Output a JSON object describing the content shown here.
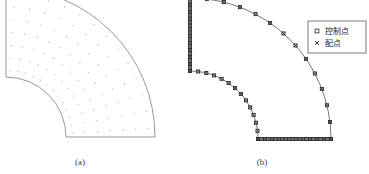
{
  "figure": {
    "type": "geometry-diagram",
    "background_color": "#ffffff",
    "panels": [
      {
        "id": "a",
        "caption": "(a)",
        "caption_x": 80,
        "caption_y": 165,
        "description": "quarter annulus domain with interior sampling point grid",
        "outline_color": "#8c8c8c",
        "fill_color": "#ffffff",
        "point_color": "#a8a8a8",
        "center_x": 6,
        "center_y": 137,
        "inner_radius": 60,
        "outer_radius": 149,
        "start_angle_deg": 0,
        "end_angle_deg": 90,
        "grid_radial_count": 7,
        "grid_circum_count": 13
      },
      {
        "id": "b",
        "caption": "(b)",
        "caption_x": 262,
        "caption_y": 165,
        "description": "quarter annulus boundary discretization showing control points and collocation points",
        "outline_color": "#555555",
        "marker_color": "#1a1a1a",
        "center_x": 190,
        "center_y": 139,
        "inner_radius": 68,
        "outer_radius": 141,
        "start_angle_deg": 0,
        "end_angle_deg": 90,
        "outer_arc_points": 14,
        "inner_arc_points": 14,
        "left_edge_points": 22,
        "bottom_edge_points": 22
      }
    ],
    "legend": {
      "box_x": 308,
      "box_y": 21,
      "box_width": 58,
      "box_height": 32,
      "border_color": "#6b6b6b",
      "fill_color": "#ffffff",
      "entries": [
        {
          "marker": "open-square",
          "label": "控制点"
        },
        {
          "marker": "cross",
          "label": "配点"
        }
      ]
    }
  },
  "chart_data": {
    "type": "scatter",
    "title": "",
    "xlabel": "",
    "ylabel": "",
    "grid": false,
    "legend_position": "top-right",
    "series": [
      {
        "name": "控制点",
        "marker": "open-square"
      },
      {
        "name": "配点",
        "marker": "cross"
      }
    ]
  }
}
